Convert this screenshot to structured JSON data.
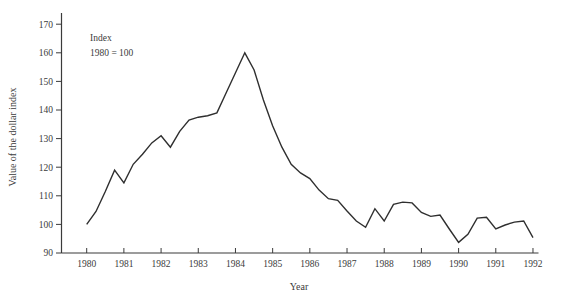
{
  "figure": {
    "background": "#ffffff",
    "text_color": "#3b3b3b",
    "axis_color": "#3b3b3b",
    "line_color": "#2f2f2f"
  },
  "chart_data": {
    "type": "line",
    "title": "",
    "annotation_lines": [
      "Index",
      "1980 = 100"
    ],
    "xlabel": "Year",
    "ylabel": "Value of the dollar index",
    "xlim": [
      1980,
      1992
    ],
    "ylim": [
      90,
      170
    ],
    "x_ticks": [
      1980,
      1981,
      1982,
      1983,
      1984,
      1985,
      1986,
      1987,
      1988,
      1989,
      1990,
      1991,
      1992
    ],
    "y_ticks": [
      90,
      100,
      110,
      120,
      130,
      140,
      150,
      160,
      170
    ],
    "grid": false,
    "legend": "none",
    "series": [
      {
        "name": "Value of the dollar index (1980 = 100)",
        "x_start": 1980,
        "x_step": 0.25,
        "values": [
          100,
          104.5,
          111.5,
          119,
          114.5,
          121,
          124.5,
          128.5,
          131,
          127,
          132.5,
          136.5,
          137.5,
          138,
          139,
          146,
          153,
          160,
          154,
          143.5,
          134.5,
          127,
          121,
          118,
          116,
          112,
          109,
          108.4,
          104.7,
          101.2,
          99,
          105.5,
          101.2,
          107,
          107.8,
          107.5,
          104.2,
          102.8,
          103.3,
          98.4,
          93.7,
          96.5,
          102.2,
          102.5,
          98.4,
          99.8,
          100.8,
          101.2,
          95.4
        ]
      }
    ]
  }
}
